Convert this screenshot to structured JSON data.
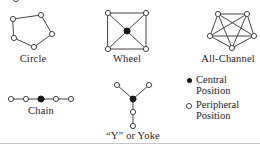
{
  "figure": {
    "networks": [
      {
        "id": "circle",
        "label": "Circle",
        "shape": "pentagon-ring",
        "nodes": 5,
        "central_positions": 0,
        "peripheral_positions": 5
      },
      {
        "id": "wheel",
        "label": "Wheel",
        "shape": "square-with-hub",
        "nodes": 5,
        "central_positions": 1,
        "peripheral_positions": 4
      },
      {
        "id": "all-channel",
        "label": "All-Channel",
        "shape": "complete-pentagon",
        "nodes": 5,
        "central_positions": 0,
        "peripheral_positions": 5
      },
      {
        "id": "chain",
        "label": "Chain",
        "shape": "line",
        "nodes": 5,
        "central_positions": 1,
        "peripheral_positions": 4
      },
      {
        "id": "y-or-yoke",
        "label": "“Y” or Yoke",
        "shape": "y-branch",
        "nodes": 5,
        "central_positions": 1,
        "peripheral_positions": 4
      }
    ],
    "legend": {
      "items": [
        {
          "marker": "filled-dot-icon",
          "line1": "Central",
          "line2": "Position"
        },
        {
          "marker": "open-circle-icon",
          "line1": "Peripheral",
          "line2": "Position"
        }
      ]
    },
    "colors": {
      "ink": "#231f20",
      "line": "#4a4446",
      "node_fill_central": "#1a1617",
      "node_fill_peripheral": "#ffffff",
      "rule": "#c9c5c4",
      "background": "#ffffff"
    }
  }
}
